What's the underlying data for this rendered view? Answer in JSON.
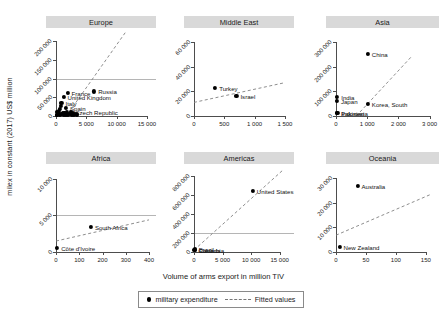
{
  "chart_data": {
    "type": "scatter",
    "title": "",
    "xlabel": "Volume of arms export in million TIV",
    "ylabel": "milex in constant (2017) US$ million",
    "grid": true,
    "legend_position": "bottom",
    "legend": [
      {
        "label": "military expenditure",
        "marker": "filled-circle"
      },
      {
        "label": "Fitted values",
        "marker": "dashed-line"
      }
    ],
    "panels": [
      {
        "name": "Europe",
        "xlim": [
          0,
          16500
        ],
        "ylim": [
          0,
          225000
        ],
        "xticks": [
          0,
          5000,
          10000,
          15000
        ],
        "xticklabels": [
          "0",
          "5 000",
          "10 000",
          "15 000"
        ],
        "yticks": [
          0,
          50000,
          100000,
          150000,
          200000
        ],
        "yticklabels": [
          "0",
          "50 000",
          "100 000",
          "150 000",
          "200 000"
        ],
        "gridlines_y": [
          100000
        ],
        "fit_line": {
          "x0": 1700,
          "y0": 0,
          "x1": 11500,
          "y1": 225000
        },
        "points": [
          {
            "label": "Russia",
            "x": 6300,
            "y": 66000,
            "label_side": "right"
          },
          {
            "label": "France",
            "x": 1900,
            "y": 62000,
            "label_side": "right"
          },
          {
            "label": "United Kingdom",
            "x": 1250,
            "y": 52000,
            "label_side": "right"
          },
          {
            "label": "Italy",
            "x": 900,
            "y": 34000,
            "label_side": "right"
          },
          {
            "label": "Spain",
            "x": 1650,
            "y": 22000,
            "label_side": "right"
          },
          {
            "label": "Czech Republic",
            "x": 2500,
            "y": 12000,
            "label_side": "right"
          },
          {
            "label": "",
            "x": 300,
            "y": 8000
          },
          {
            "label": "",
            "x": 450,
            "y": 14000
          },
          {
            "label": "",
            "x": 620,
            "y": 19000
          },
          {
            "label": "",
            "x": 780,
            "y": 27000
          },
          {
            "label": "",
            "x": 1100,
            "y": 9000
          },
          {
            "label": "",
            "x": 1400,
            "y": 7000
          },
          {
            "label": "",
            "x": 1750,
            "y": 10000
          },
          {
            "label": "",
            "x": 2100,
            "y": 6000
          },
          {
            "label": "",
            "x": 2400,
            "y": 5000
          },
          {
            "label": "",
            "x": 2800,
            "y": 8000
          },
          {
            "label": "",
            "x": 3100,
            "y": 6500
          },
          {
            "label": "",
            "x": 3500,
            "y": 5500
          },
          {
            "label": "",
            "x": 200,
            "y": 4000
          },
          {
            "label": "",
            "x": 150,
            "y": 12000
          },
          {
            "label": "",
            "x": 520,
            "y": 5000
          },
          {
            "label": "",
            "x": 900,
            "y": 5200
          },
          {
            "label": "",
            "x": 1250,
            "y": 4500
          },
          {
            "label": "",
            "x": 1600,
            "y": 4000
          },
          {
            "label": "",
            "x": 2000,
            "y": 3500
          },
          {
            "label": "",
            "x": 2600,
            "y": 4200
          },
          {
            "label": "",
            "x": 3000,
            "y": 3800
          },
          {
            "label": "",
            "x": 3400,
            "y": 3200
          },
          {
            "label": "",
            "x": 100,
            "y": 2500
          },
          {
            "label": "",
            "x": 700,
            "y": 2800
          }
        ]
      },
      {
        "name": "Middle East",
        "xlim": [
          0,
          1650
        ],
        "ylim": [
          0,
          68000
        ],
        "xticks": [
          0,
          500,
          1000,
          1500
        ],
        "xticklabels": [
          "0",
          "500",
          "1 000",
          "1 500"
        ],
        "yticks": [
          0,
          20000,
          40000,
          60000
        ],
        "yticklabels": [
          "0",
          "20 000",
          "40 000",
          "60 000"
        ],
        "gridlines_y": [],
        "fit_line": {
          "x0": 0,
          "y0": 11000,
          "x1": 1500,
          "y1": 27000
        },
        "points": [
          {
            "label": "Turkey",
            "x": 350,
            "y": 22500,
            "label_side": "right"
          },
          {
            "label": "Israel",
            "x": 700,
            "y": 16500,
            "label_side": "right"
          }
        ]
      },
      {
        "name": "Asia",
        "xlim": [
          0,
          3300
        ],
        "ylim": [
          0,
          340000
        ],
        "xticks": [
          0,
          1000,
          2000,
          3000
        ],
        "xticklabels": [
          "0",
          "1 000",
          "2 000",
          "3 000"
        ],
        "yticks": [
          0,
          100000,
          200000,
          300000
        ],
        "yticklabels": [
          "0",
          "100 000",
          "200 000",
          "300 000"
        ],
        "gridlines_y": [],
        "fit_line": {
          "x0": 650,
          "y0": 0,
          "x1": 2400,
          "y1": 238000
        },
        "points": [
          {
            "label": "China",
            "x": 1020,
            "y": 252000,
            "label_side": "right"
          },
          {
            "label": "India",
            "x": 40,
            "y": 78000,
            "label_side": "right"
          },
          {
            "label": "Japan",
            "x": 30,
            "y": 62000,
            "label_side": "right"
          },
          {
            "label": "Korea, South",
            "x": 1020,
            "y": 48000,
            "label_side": "right"
          },
          {
            "label": "Pakistan",
            "x": 35,
            "y": 13000,
            "label_side": "right"
          },
          {
            "label": "Indonesia",
            "x": 45,
            "y": 11000,
            "label_side": "right"
          }
        ]
      },
      {
        "name": "Africa",
        "xlim": [
          0,
          430
        ],
        "ylim": [
          0,
          11500
        ],
        "xticks": [
          0,
          100,
          200,
          300,
          400
        ],
        "xticklabels": [
          "0",
          "100",
          "200",
          "300",
          "400"
        ],
        "yticks": [
          0,
          5000,
          10000
        ],
        "yticklabels": [
          "0",
          "5 000",
          "10 000"
        ],
        "gridlines_y": [
          5000
        ],
        "fit_line": {
          "x0": 0,
          "y0": 1500,
          "x1": 400,
          "y1": 4400
        },
        "points": [
          {
            "label": "South Africa",
            "x": 150,
            "y": 3400,
            "label_side": "right"
          },
          {
            "label": "Côte d'Ivoire",
            "x": 5,
            "y": 600,
            "label_side": "right"
          }
        ]
      },
      {
        "name": "Americas",
        "xlim": [
          0,
          17500
        ],
        "ylim": [
          0,
          880000
        ],
        "xticks": [
          0,
          5000,
          10000,
          15000
        ],
        "xticklabels": [
          "0",
          "5 000",
          "10 000",
          "15 000"
        ],
        "yticks": [
          0,
          200000,
          400000,
          600000,
          800000
        ],
        "yticklabels": [
          "0",
          "200 000",
          "400 000",
          "600 000",
          "800 000"
        ],
        "gridlines_y": [
          200000
        ],
        "fit_line": {
          "x0": 0,
          "y0": 20000,
          "x1": 15500,
          "y1": 855000
        },
        "points": [
          {
            "label": "United States",
            "x": 10300,
            "y": 640000,
            "label_side": "right"
          },
          {
            "label": "Brazil",
            "x": 120,
            "y": 32000,
            "label_side": "right"
          },
          {
            "label": "Canada",
            "x": 200,
            "y": 26000,
            "label_side": "right"
          },
          {
            "label": "Colombia",
            "x": 60,
            "y": 20000,
            "label_side": "right"
          }
        ]
      },
      {
        "name": "Oceania",
        "xlim": [
          0,
          172
        ],
        "ylim": [
          0,
          34000
        ],
        "xticks": [
          0,
          50,
          100,
          150
        ],
        "xticklabels": [
          "0",
          "50",
          "100",
          "150"
        ],
        "yticks": [
          0,
          10000,
          20000,
          30000
        ],
        "yticklabels": [
          "0",
          "10 000",
          "20 000",
          "30 000"
        ],
        "gridlines_y": [],
        "fit_line": {
          "x0": 0,
          "y0": 6800,
          "x1": 160,
          "y1": 23500
        },
        "points": [
          {
            "label": "Australia",
            "x": 36,
            "y": 26800,
            "label_side": "right"
          },
          {
            "label": "New Zealand",
            "x": 6,
            "y": 2200,
            "label_side": "right"
          }
        ]
      }
    ]
  }
}
